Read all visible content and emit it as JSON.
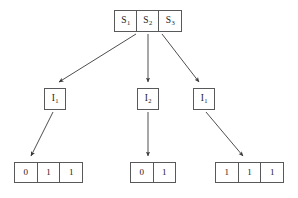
{
  "diagram": {
    "type": "tree",
    "background_color": "#ffffff",
    "stroke_color": "#58595b",
    "text_color": "#1a1a1a",
    "root": {
      "name": "root-node",
      "cells": [
        {
          "base": "S",
          "sub": "1"
        },
        {
          "base": "S",
          "sub": "2"
        },
        {
          "base": "S",
          "sub": "3"
        }
      ]
    },
    "intermediate": [
      {
        "name": "mid-node-left",
        "base": "I",
        "sub": "1"
      },
      {
        "name": "mid-node-mid",
        "base": "I",
        "sub": "2"
      },
      {
        "name": "mid-node-right",
        "base": "I",
        "sub": "1"
      }
    ],
    "leaves": [
      {
        "name": "leaf-left",
        "bits": [
          "0",
          "1",
          "1"
        ]
      },
      {
        "name": "leaf-mid",
        "bits": [
          "0",
          "1"
        ]
      },
      {
        "name": "leaf-right",
        "bits": [
          "1",
          "1",
          "1"
        ]
      }
    ],
    "edges": [
      {
        "from": "root-node",
        "to": "mid-node-left",
        "style": "arrow"
      },
      {
        "from": "root-node",
        "to": "mid-node-mid",
        "style": "arrow"
      },
      {
        "from": "root-node",
        "to": "mid-node-right",
        "style": "arrow"
      },
      {
        "from": "mid-node-left",
        "to": "leaf-left",
        "style": "arrow"
      },
      {
        "from": "mid-node-mid",
        "to": "leaf-mid",
        "style": "arrow"
      },
      {
        "from": "mid-node-right",
        "to": "leaf-right",
        "style": "arrow"
      }
    ]
  }
}
